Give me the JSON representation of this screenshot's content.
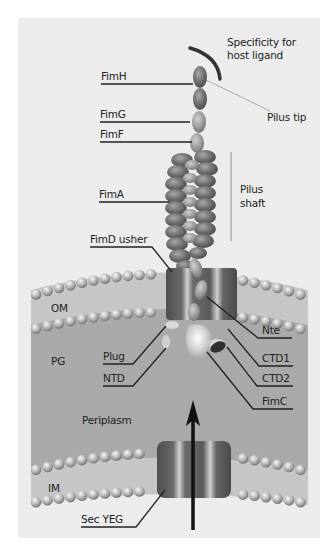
{
  "diagram": {
    "labels": {
      "specificity": [
        "Specificity for",
        "host ligand"
      ],
      "pilus_tip": "Pilus tip",
      "pilus_shaft": [
        "Pilus",
        "shaft"
      ],
      "fimH": "FimH",
      "fimG": "FimG",
      "fimF": "FimF",
      "fimA": "FimA",
      "fimD": "FimD usher",
      "om": "OM",
      "pg": "PG",
      "plug": "Plug",
      "ntd": "NTD",
      "nte": "Nte",
      "ctd1": "CTD1",
      "ctd2": "CTD2",
      "fimC": "FimC",
      "periplasm": "Periplasm",
      "im": "IM",
      "secyeg": "Sec YEG"
    },
    "colors": {
      "background": "#ececec",
      "periplasm": "#a9a9a9",
      "membrane_band": "#c9c9c9",
      "bead": "#b8b8b8",
      "subunit": "#6e6e6e",
      "usher": "#5f5f5f",
      "leader_line": "#222222"
    }
  }
}
